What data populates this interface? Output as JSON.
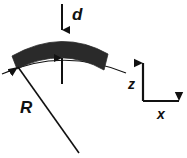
{
  "figure": {
    "type": "scientific-schematic",
    "background_color": "#ffffff",
    "band_fill_color": "#2a2a2a",
    "line_color": "#111111",
    "labels": {
      "thickness": "d",
      "radius": "R",
      "axis_vertical": "z",
      "axis_horizontal": "x"
    },
    "annotations": [
      {
        "name": "thickness-arrow-top",
        "label": "d",
        "direction": "down"
      },
      {
        "name": "thickness-arrow-bottom",
        "label": "",
        "direction": "up"
      },
      {
        "name": "radius-leader-line",
        "label": "R",
        "direction": "up-left"
      }
    ],
    "axes": {
      "origin_label": "",
      "vertical": {
        "label": "z",
        "direction": "up"
      },
      "horizontal": {
        "label": "x",
        "direction": "right"
      }
    }
  }
}
